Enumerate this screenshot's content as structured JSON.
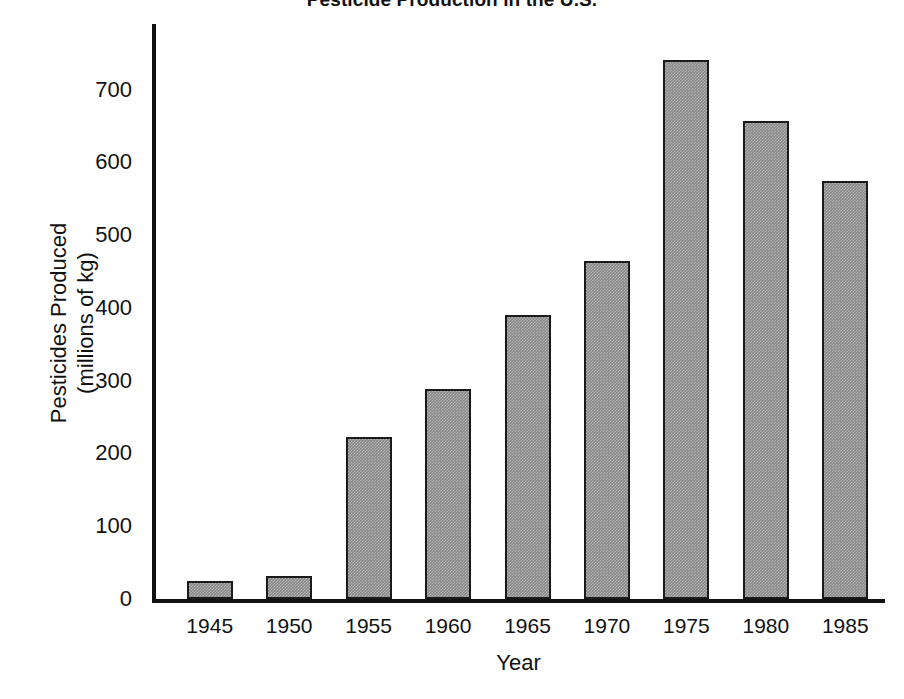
{
  "chart_data": {
    "type": "bar",
    "title": "Pesticide Production in the U.S.",
    "xlabel": "Year",
    "ylabel_line1": "Pesticides Produced",
    "ylabel_line2": "(millions of kg)",
    "categories": [
      "1945",
      "1950",
      "1955",
      "1960",
      "1965",
      "1970",
      "1975",
      "1980",
      "1985"
    ],
    "values": [
      25,
      32,
      222,
      288,
      390,
      465,
      740,
      657,
      575
    ],
    "ytick_labels": [
      "700",
      "600",
      "500",
      "400",
      "300",
      "200",
      "100",
      "0"
    ],
    "ytick_values": [
      700,
      600,
      500,
      400,
      300,
      200,
      100,
      0
    ],
    "ylim": [
      0,
      790
    ],
    "xlim_note": "categorical",
    "grid": false,
    "legend": "none",
    "bar_fill_color": "#8a8a8a",
    "bar_edge_color": "#1a1a1a",
    "axis_color": "#111111",
    "background_color": "#ffffff"
  }
}
